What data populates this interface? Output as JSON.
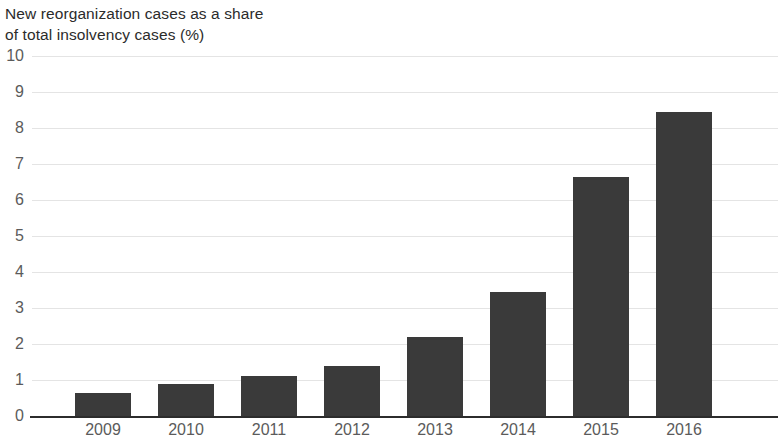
{
  "chart_data": {
    "type": "bar",
    "title": "New reorganization cases as a share\nof total insolvency cases (%)",
    "title_line1": "New reorganization cases as a share",
    "title_line2": "of total insolvency cases (%)",
    "xlabel": "",
    "ylabel": "",
    "categories": [
      "2009",
      "2010",
      "2011",
      "2012",
      "2013",
      "2014",
      "2015",
      "2016"
    ],
    "values": [
      0.64,
      0.89,
      1.1,
      1.39,
      2.2,
      3.45,
      6.65,
      8.45
    ],
    "series": [
      {
        "name": "New reorganization cases as a share of total insolvency cases (%)",
        "values": [
          0.64,
          0.89,
          1.1,
          1.39,
          2.2,
          3.45,
          6.65,
          8.45
        ]
      }
    ],
    "ylim": [
      0,
      10
    ],
    "yticks": [
      0,
      1,
      2,
      3,
      4,
      5,
      6,
      7,
      8,
      9,
      10
    ],
    "ytick_labels": [
      "0",
      "1",
      "2",
      "3",
      "4",
      "5",
      "6",
      "7",
      "8",
      "9",
      "10"
    ],
    "grid": true,
    "grid_axis": "y",
    "legend": false,
    "legend_position": "none",
    "bar_color": "#3a3a3a",
    "gridline_color": "#e4e4e4",
    "axis_color": "#2c2c2c",
    "tick_label_color": "#5b5b5b",
    "title_color": "#2b2b2b",
    "background_color": "#ffffff"
  }
}
